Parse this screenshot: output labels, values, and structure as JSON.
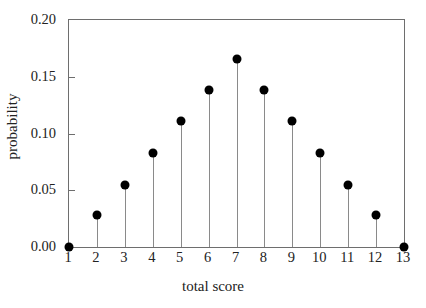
{
  "chart_data": {
    "type": "scatter",
    "subtype": "stem",
    "title": "",
    "xlabel": "total score",
    "ylabel": "probability",
    "x": [
      1,
      2,
      3,
      4,
      5,
      6,
      7,
      8,
      9,
      10,
      11,
      12,
      13
    ],
    "values": [
      0.0,
      0.028,
      0.055,
      0.083,
      0.111,
      0.138,
      0.166,
      0.138,
      0.111,
      0.083,
      0.055,
      0.028,
      0.0
    ],
    "categories": [
      "1",
      "2",
      "3",
      "4",
      "5",
      "6",
      "7",
      "8",
      "9",
      "10",
      "11",
      "12",
      "13"
    ],
    "xlim": [
      1,
      13
    ],
    "ylim": [
      0.0,
      0.2
    ],
    "xticks": [
      1,
      2,
      3,
      4,
      5,
      6,
      7,
      8,
      9,
      10,
      11,
      12,
      13
    ],
    "xtick_labels": [
      "1",
      "2",
      "3",
      "4",
      "5",
      "6",
      "7",
      "8",
      "9",
      "10",
      "11",
      "12",
      "13"
    ],
    "yticks": [
      0.0,
      0.05,
      0.1,
      0.15,
      0.2
    ],
    "ytick_labels": [
      "0.00",
      "0.05",
      "0.10",
      "0.15",
      "0.20"
    ],
    "grid": false,
    "legend": null,
    "marker": "filled-circle",
    "marker_color": "#000000",
    "stem_color": "#8a8a8a",
    "frame_color": "#6e6e6e",
    "background": "#ffffff"
  }
}
